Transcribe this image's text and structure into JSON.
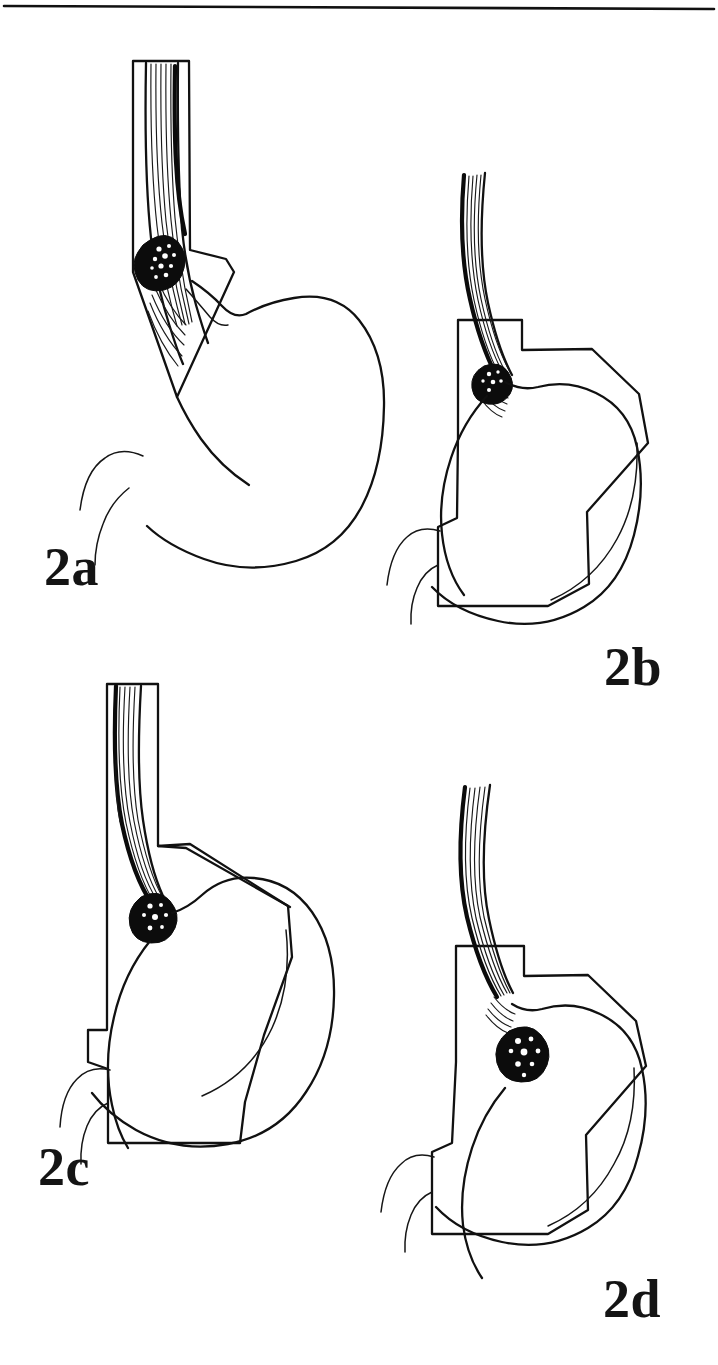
{
  "figure": {
    "id": "figure-2",
    "kind": "medical-line-drawing",
    "background_color": "#ffffff",
    "ink_color": "#111111",
    "top_rule": {
      "present": true,
      "label": "horizontal-rule"
    }
  },
  "panels": [
    {
      "key": "2a",
      "label": "2a",
      "label_position": "below-left",
      "title": "Tumour of the mid/lower oesophagus",
      "tumour_site": "lower oesophagus, above the gastro-oesophageal junction",
      "stomach_shown": "whole stomach, intact",
      "resection_outline": "oesophagus plus gastric cardia wedge",
      "anatomy": [
        "oesophagus",
        "mucosal folds",
        "tumour mass",
        "stomach",
        "fundus",
        "greater curvature",
        "lesser curvature",
        "duodenum"
      ]
    },
    {
      "key": "2b",
      "label": "2b",
      "label_position": "below-right",
      "title": "Resection specimen for a lower oesophageal tumour",
      "tumour_site": "gastro-oesophageal junction, oesophageal side",
      "stomach_shown": "proximal stomach within resection margin",
      "resection_outline": "polygonal margin enclosing proximal stomach and distal oesophagus",
      "anatomy": [
        "oesophagus",
        "mucosal folds",
        "tumour mass",
        "stomach",
        "resection margin",
        "duodenum"
      ]
    },
    {
      "key": "2c",
      "label": "2c",
      "label_position": "below-left",
      "title": "Tumour at the gastro-oesophageal junction",
      "tumour_site": "gastro-oesophageal junction, cardia",
      "stomach_shown": "stomach within resection margin",
      "resection_outline": "polygonal margin enclosing stomach and distal oesophagus",
      "anatomy": [
        "oesophagus",
        "mucosal folds",
        "tumour mass",
        "stomach",
        "resection margin",
        "duodenum"
      ]
    },
    {
      "key": "2d",
      "label": "2d",
      "label_position": "below-right",
      "title": "Tumour of the gastric cardia",
      "tumour_site": "gastric cardia, below the gastro-oesophageal junction",
      "stomach_shown": "stomach within resection margin",
      "resection_outline": "polygonal margin enclosing stomach and distal oesophagus",
      "anatomy": [
        "oesophagus",
        "mucosal folds",
        "tumour mass",
        "stomach",
        "resection margin",
        "duodenum"
      ]
    }
  ]
}
